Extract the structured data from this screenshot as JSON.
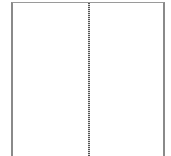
{
  "layout": {
    "type": "two-column-page",
    "columns": [
      {
        "name": "left",
        "content": ""
      },
      {
        "name": "right",
        "content": ""
      }
    ],
    "divider": {
      "style": "dotted",
      "color": "#555555"
    },
    "border_color": "#8a8a8a"
  }
}
